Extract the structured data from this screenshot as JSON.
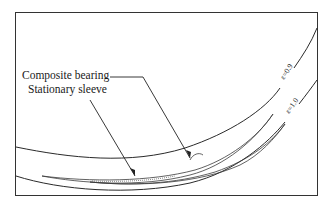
{
  "figure": {
    "labels": {
      "composite": "Composite bearing",
      "stationary": "Stationary sleeve"
    },
    "curves": [
      {
        "name": "eccentricity-0.9",
        "label": "ε=0.9"
      },
      {
        "name": "eccentricity-1.0",
        "label": "ε=1.0"
      }
    ],
    "colors": {
      "line": "#2a2a2a",
      "background": "#ffffff"
    }
  }
}
